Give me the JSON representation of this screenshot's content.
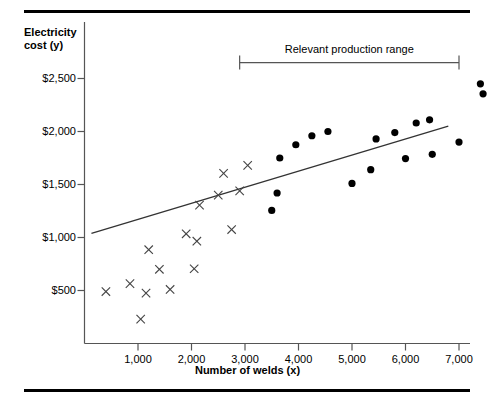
{
  "figure": {
    "y_axis_title": "Electricity",
    "y_axis_title_line2": "cost (y)",
    "x_axis_title": "Number of welds (x)",
    "annotation": "Relevant production range",
    "line_color": "#333333",
    "marker_color": "#000000",
    "axis_color": "#555555",
    "rule_color": "#000000"
  },
  "chart_data": {
    "type": "scatter",
    "title": "",
    "subtitle": "",
    "xlabel": "Number of welds (x)",
    "ylabel": "Electricity cost (y)",
    "xlim": [
      0,
      7700
    ],
    "ylim": [
      0,
      2700
    ],
    "grid": false,
    "legend": "none",
    "x_ticks": [
      1000,
      2000,
      3000,
      4000,
      5000,
      6000,
      7000
    ],
    "x_tick_labels": [
      "1,000",
      "2,000",
      "3,000",
      "4,000",
      "5,000",
      "6,000",
      "7,000"
    ],
    "y_ticks": [
      500,
      1000,
      1500,
      2000,
      2500
    ],
    "y_tick_labels": [
      "$500",
      "$1,000",
      "$1,500",
      "$2,000",
      "$2,500"
    ],
    "annotations": [
      {
        "text": "Relevant production range",
        "type": "range-bracket",
        "x_start": 2900,
        "x_end": 7000,
        "y": 2650
      }
    ],
    "series": [
      {
        "name": "Outside relevant range",
        "marker": "x",
        "color": "#444444",
        "points": [
          [
            400,
            490
          ],
          [
            850,
            565
          ],
          [
            1050,
            230
          ],
          [
            1150,
            475
          ],
          [
            1200,
            885
          ],
          [
            1400,
            700
          ],
          [
            1600,
            510
          ],
          [
            1900,
            1035
          ],
          [
            2050,
            705
          ],
          [
            2100,
            965
          ],
          [
            2150,
            1305
          ],
          [
            2500,
            1400
          ],
          [
            2600,
            1605
          ],
          [
            2750,
            1075
          ],
          [
            2900,
            1440
          ],
          [
            3050,
            1680
          ]
        ]
      },
      {
        "name": "Within relevant range",
        "marker": "o",
        "color": "#000000",
        "points": [
          [
            3500,
            1255
          ],
          [
            3600,
            1420
          ],
          [
            3650,
            1750
          ],
          [
            3950,
            1875
          ],
          [
            4250,
            1960
          ],
          [
            4550,
            2000
          ],
          [
            5000,
            1510
          ],
          [
            5350,
            1640
          ],
          [
            5450,
            1930
          ],
          [
            5800,
            1990
          ],
          [
            6000,
            1745
          ],
          [
            6200,
            2080
          ],
          [
            6450,
            2110
          ],
          [
            6500,
            1785
          ],
          [
            7000,
            1900
          ],
          [
            7400,
            2450
          ],
          [
            7450,
            2355
          ]
        ]
      }
    ],
    "trend_line": {
      "name": "Fitted cost line",
      "x_start": 130,
      "y_start": 1040,
      "x_end": 6800,
      "y_end": 2050,
      "color": "#333333"
    }
  }
}
